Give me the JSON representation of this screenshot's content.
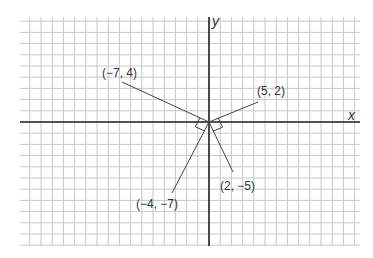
{
  "diagram": {
    "axes": {
      "x_label": "x",
      "y_label": "y"
    },
    "grid": {
      "unit_px": 11.2,
      "x_range": [
        -17,
        13
      ],
      "y_range": [
        -11,
        9
      ]
    },
    "points": [
      {
        "label": "(−7, 4)",
        "x": -7,
        "y": 4
      },
      {
        "label": "(5, 2)",
        "x": 5,
        "y": 2
      },
      {
        "label": "(2, −5)",
        "x": 2,
        "y": -5
      },
      {
        "label": "(−4, −7)",
        "x": -4,
        "y": -7
      }
    ],
    "right_angles": [
      {
        "between": [
          "(−7, 4)",
          "(−4, −7)"
        ]
      },
      {
        "between": [
          "(5, 2)",
          "(2, −5)"
        ]
      }
    ],
    "colors": {
      "grid": "#c8c8c8",
      "axis": "#222222",
      "segment": "#444444",
      "text": "#333333"
    }
  }
}
